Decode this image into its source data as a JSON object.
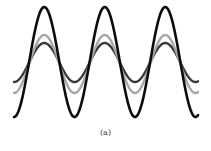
{
  "figure": {
    "caption": "(a)",
    "x_start": 14,
    "x_end": 198,
    "period_px": 60.5,
    "phase_trough_x": 14,
    "waves": [
      {
        "name": "small-dark-wave",
        "color": "#3a3a3a",
        "center_y": 62.5,
        "amplitude": 19.5,
        "stroke_width": 2.4
      },
      {
        "name": "medium-gray-wave",
        "color": "#a8a8a8",
        "center_y": 64,
        "amplitude": 29,
        "stroke_width": 2.4
      },
      {
        "name": "large-black-wave",
        "color": "#0d0d0d",
        "center_y": 62,
        "amplitude": 55,
        "stroke_width": 2.6
      }
    ]
  }
}
